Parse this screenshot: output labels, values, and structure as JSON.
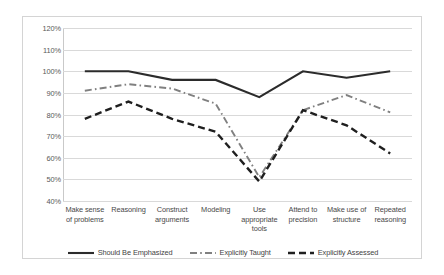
{
  "chart_data": {
    "type": "line",
    "title": "",
    "xlabel": "",
    "ylabel": "",
    "ylim": [
      40,
      120
    ],
    "ytick_step": 10,
    "grid": true,
    "legend_position": "bottom",
    "ytick_labels": [
      "120%",
      "110%",
      "100%",
      "90%",
      "80%",
      "70%",
      "60%",
      "50%",
      "40%"
    ],
    "categories": [
      "Make sense of problems",
      "Reasoning",
      "Construct arguments",
      "Modeling",
      "Use appropriate tools",
      "Attend to precision",
      "Make use of structure",
      "Repeated reasoning"
    ],
    "category_lines": [
      [
        "Make sense",
        "of problems"
      ],
      [
        "Reasoning"
      ],
      [
        "Construct",
        "arguments"
      ],
      [
        "Modeling"
      ],
      [
        "Use",
        "appropriate",
        "tools"
      ],
      [
        "Attend to",
        "precision"
      ],
      [
        "Make use of",
        "structure"
      ],
      [
        "Repeated",
        "reasoning"
      ]
    ],
    "series": [
      {
        "name": "Should Be Emphasized",
        "style": "solid",
        "color": "#2b2b2b",
        "width": 2.1,
        "values": [
          100,
          100,
          96,
          96,
          88,
          100,
          97,
          100
        ]
      },
      {
        "name": "Explicitly Taught",
        "style": "dash-dot",
        "color": "#808080",
        "width": 1.9,
        "values": [
          91,
          94,
          92,
          85,
          51,
          82,
          89,
          81
        ]
      },
      {
        "name": "Explicitly Assessed",
        "style": "dashed",
        "color": "#1f1f1f",
        "width": 2.4,
        "values": [
          78,
          86,
          78,
          72,
          49,
          82,
          75,
          62
        ]
      }
    ]
  },
  "colors": {
    "gridline": "#d9d9d9",
    "border": "#d4d4d4",
    "axis_text": "#595959",
    "background": "#ffffff"
  }
}
